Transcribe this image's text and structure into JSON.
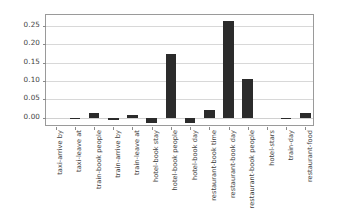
{
  "figure": {
    "background_color": "#ffffff",
    "bar_color": "#2b2b2b",
    "grid_color": "#d8d8d8",
    "axis_color": "#9a9a9a"
  },
  "chart_data": {
    "type": "bar",
    "title": "",
    "subtitle": "",
    "xlabel": "",
    "ylabel": "",
    "grid": true,
    "legend": null,
    "legend_position": "none",
    "orientation": "vertical",
    "xtick_rotation": -90,
    "ylim": [
      -0.025,
      0.28
    ],
    "yticks": [
      0.0,
      0.05,
      0.1,
      0.15,
      0.2,
      0.25
    ],
    "ytick_labels": [
      "0.00",
      "0.05",
      "0.10",
      "0.15",
      "0.20",
      "0.25"
    ],
    "categories": [
      "taxi-arrive by",
      "taxi-leave at",
      "train-book people",
      "train-arrive by",
      "train-leave at",
      "hotel-book stay",
      "hotel-book people",
      "hotel-book day",
      "restaurant-book time",
      "restaurant-book day",
      "restaurant-book people",
      "hotel-stars",
      "train-day",
      "restaurant-food"
    ],
    "values": [
      0.0,
      -0.004,
      0.013,
      -0.006,
      0.007,
      -0.015,
      0.175,
      -0.014,
      0.021,
      0.264,
      0.105,
      0.0,
      -0.002,
      0.014
    ]
  }
}
